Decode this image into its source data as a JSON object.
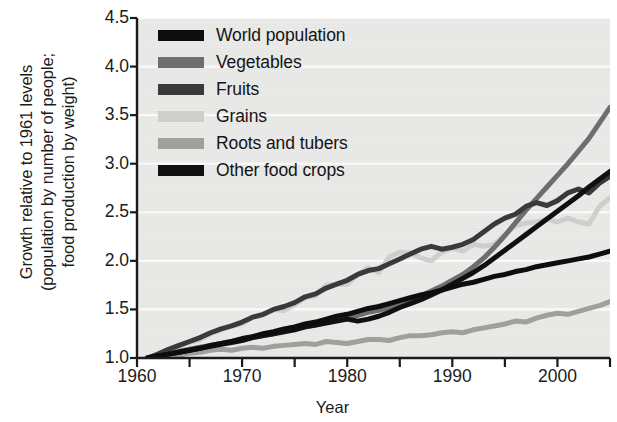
{
  "chart_data": {
    "type": "line",
    "title": "",
    "xlabel": "Year",
    "ylabel": "Growth relative to 1961 levels (population by number of people; food production by weight)",
    "ylabel_lines": [
      "Growth relative to 1961 levels",
      "(population by number of people;",
      "food production by weight)"
    ],
    "xlim": [
      1960,
      2005
    ],
    "ylim": [
      1.0,
      4.5
    ],
    "xticks": [
      1960,
      1970,
      1980,
      1990,
      2000
    ],
    "xticklabels": [
      "1960",
      "1970",
      "1980",
      "1990",
      "2000"
    ],
    "xminor_ticks": [
      1965,
      1975,
      1985,
      1995,
      2005
    ],
    "yticks": [
      1.0,
      1.5,
      2.0,
      2.5,
      3.0,
      3.5,
      4.0,
      4.5
    ],
    "yticklabels": [
      "1.0",
      "1.5",
      "2.0",
      "2.5",
      "3.0",
      "3.5",
      "4.0",
      "4.5"
    ],
    "grid": true,
    "grid_color": "#fbfbfa",
    "plot_background": "#e9e9e7",
    "legend_position": "upper-left-inside",
    "x": [
      1961,
      1962,
      1963,
      1964,
      1965,
      1966,
      1967,
      1968,
      1969,
      1970,
      1971,
      1972,
      1973,
      1974,
      1975,
      1976,
      1977,
      1978,
      1979,
      1980,
      1981,
      1982,
      1983,
      1984,
      1985,
      1986,
      1987,
      1988,
      1989,
      1990,
      1991,
      1992,
      1993,
      1994,
      1995,
      1996,
      1997,
      1998,
      1999,
      2000,
      2001,
      2002,
      2003,
      2004,
      2005
    ],
    "series": [
      {
        "name": "World population",
        "color": "#0d0d0d",
        "width": 5.0,
        "values": [
          1.0,
          1.02,
          1.04,
          1.06,
          1.08,
          1.1,
          1.13,
          1.15,
          1.17,
          1.2,
          1.22,
          1.25,
          1.27,
          1.3,
          1.32,
          1.35,
          1.37,
          1.4,
          1.43,
          1.45,
          1.48,
          1.51,
          1.53,
          1.56,
          1.59,
          1.62,
          1.65,
          1.67,
          1.7,
          1.73,
          1.76,
          1.78,
          1.81,
          1.84,
          1.86,
          1.89,
          1.91,
          1.94,
          1.96,
          1.98,
          2.0,
          2.02,
          2.04,
          2.07,
          2.1
        ]
      },
      {
        "name": "Vegetables",
        "color": "#6e6e6e",
        "width": 5.0,
        "values": [
          1.0,
          1.03,
          1.05,
          1.07,
          1.09,
          1.11,
          1.13,
          1.15,
          1.17,
          1.19,
          1.22,
          1.23,
          1.25,
          1.28,
          1.3,
          1.32,
          1.34,
          1.37,
          1.39,
          1.41,
          1.44,
          1.47,
          1.49,
          1.52,
          1.55,
          1.59,
          1.64,
          1.69,
          1.74,
          1.8,
          1.86,
          1.94,
          2.03,
          2.14,
          2.26,
          2.39,
          2.52,
          2.64,
          2.76,
          2.88,
          3.0,
          3.13,
          3.26,
          3.42,
          3.58
        ]
      },
      {
        "name": "Fruits",
        "color": "#3a3a3a",
        "width": 5.0,
        "values": [
          1.0,
          1.04,
          1.09,
          1.13,
          1.17,
          1.21,
          1.26,
          1.3,
          1.33,
          1.37,
          1.42,
          1.45,
          1.5,
          1.53,
          1.57,
          1.63,
          1.66,
          1.72,
          1.76,
          1.8,
          1.86,
          1.9,
          1.92,
          1.97,
          2.02,
          2.07,
          2.12,
          2.15,
          2.12,
          2.14,
          2.17,
          2.22,
          2.3,
          2.38,
          2.44,
          2.48,
          2.56,
          2.6,
          2.57,
          2.62,
          2.7,
          2.74,
          2.7,
          2.8,
          2.87
        ]
      },
      {
        "name": "Grains",
        "color": "#cfcfcd",
        "width": 5.0,
        "values": [
          1.0,
          1.04,
          1.08,
          1.13,
          1.16,
          1.19,
          1.25,
          1.29,
          1.33,
          1.35,
          1.42,
          1.44,
          1.5,
          1.49,
          1.55,
          1.62,
          1.64,
          1.75,
          1.76,
          1.76,
          1.86,
          1.93,
          1.88,
          2.04,
          2.09,
          2.08,
          2.03,
          2.0,
          2.09,
          2.13,
          2.1,
          2.17,
          2.15,
          2.17,
          2.27,
          2.36,
          2.39,
          2.4,
          2.43,
          2.4,
          2.44,
          2.4,
          2.38,
          2.56,
          2.65
        ]
      },
      {
        "name": "Roots and tubers",
        "color": "#a0a09e",
        "width": 5.0,
        "values": [
          1.0,
          1.02,
          1.03,
          1.03,
          1.05,
          1.06,
          1.08,
          1.09,
          1.08,
          1.1,
          1.11,
          1.1,
          1.12,
          1.13,
          1.14,
          1.15,
          1.14,
          1.17,
          1.16,
          1.15,
          1.17,
          1.19,
          1.19,
          1.18,
          1.21,
          1.23,
          1.23,
          1.24,
          1.26,
          1.27,
          1.26,
          1.29,
          1.31,
          1.33,
          1.35,
          1.38,
          1.37,
          1.41,
          1.44,
          1.46,
          1.45,
          1.48,
          1.51,
          1.54,
          1.58
        ]
      },
      {
        "name": "Other food crops",
        "color": "#101010",
        "width": 5.0,
        "values": [
          1.0,
          1.02,
          1.04,
          1.06,
          1.08,
          1.1,
          1.12,
          1.14,
          1.16,
          1.18,
          1.21,
          1.23,
          1.25,
          1.27,
          1.29,
          1.32,
          1.34,
          1.36,
          1.38,
          1.4,
          1.38,
          1.4,
          1.43,
          1.47,
          1.52,
          1.56,
          1.6,
          1.65,
          1.7,
          1.76,
          1.82,
          1.88,
          1.95,
          2.03,
          2.11,
          2.19,
          2.27,
          2.35,
          2.43,
          2.51,
          2.59,
          2.67,
          2.76,
          2.84,
          2.92
        ]
      }
    ]
  },
  "legend": {
    "items": [
      {
        "label": "World population",
        "color": "#0d0d0d"
      },
      {
        "label": "Vegetables",
        "color": "#6e6e6e"
      },
      {
        "label": "Fruits",
        "color": "#3a3a3a"
      },
      {
        "label": "Grains",
        "color": "#cfcfcd"
      },
      {
        "label": "Roots and tubers",
        "color": "#a0a09e"
      },
      {
        "label": "Other food crops",
        "color": "#101010"
      }
    ]
  }
}
